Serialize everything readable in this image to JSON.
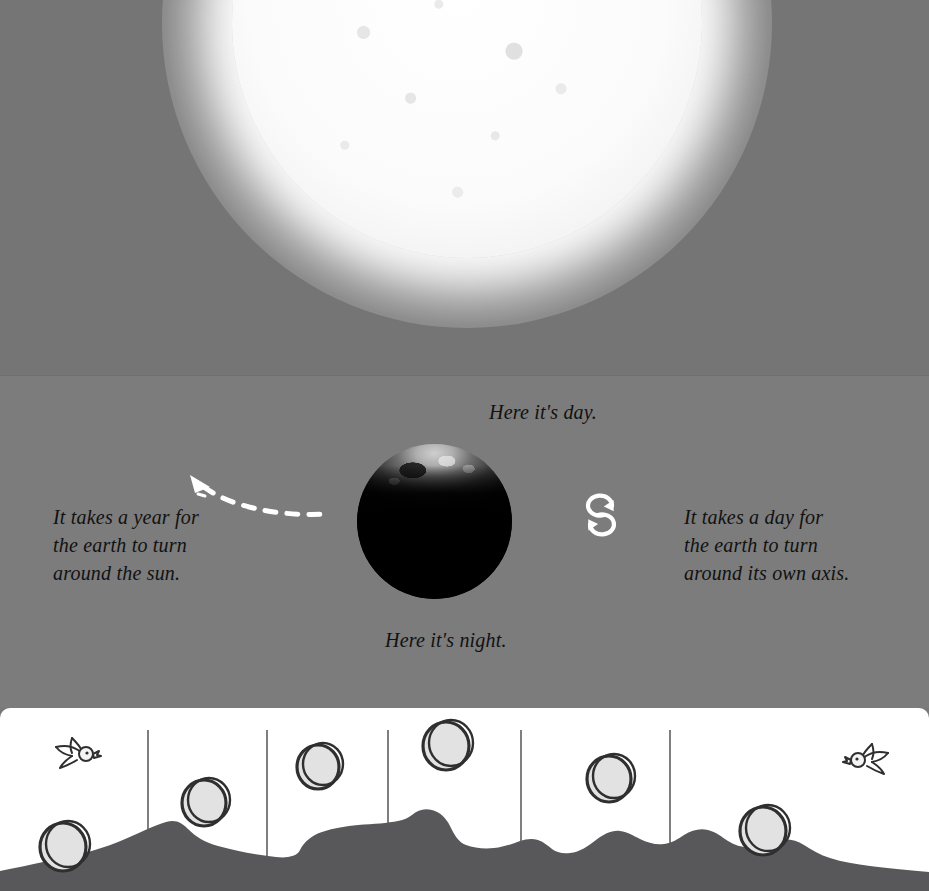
{
  "page": {
    "width": 929,
    "height": 891,
    "background_color": "#787878",
    "panel_background_color": "#ffffff"
  },
  "space_scene": {
    "sun": {
      "name": "sun",
      "color": "#ffffff",
      "glow_color": "#ffffff",
      "description": "bright glowing sun partially cropped at top of frame"
    },
    "earth": {
      "name": "earth",
      "day_side_color": "#cfcfcf",
      "night_side_color": "#050505",
      "description": "earth globe lit on the top half facing the sun, dark on the bottom half"
    },
    "captions": {
      "day": "Here it's day.",
      "night": "Here it's night.",
      "year": "It takes a year for the earth to turn around the sun.",
      "axis": "It takes a day for the earth to turn around its own axis."
    },
    "caption_lines": {
      "year": [
        "It takes a year for",
        "the earth to turn",
        "around the sun."
      ],
      "axis": [
        "It takes a day for",
        "the earth to turn",
        "around its own axis."
      ]
    },
    "text_color": "#111111",
    "orbit_arrow": {
      "name": "dashed-orbit-arrow",
      "color": "#ffffff",
      "direction": "counter-clockwise toward upper-left"
    },
    "rotation_icon": {
      "name": "rotation-arrows-icon",
      "color": "#ffffff",
      "description": "two curved arrows forming a rotation loop"
    }
  },
  "ground_scene": {
    "background_color": "#ffffff",
    "hill_color": "#58585a",
    "line_color": "#3a3a3a",
    "sun_fill_color": "#e2e2e2",
    "sun_stroke_color": "#2f2f2f",
    "bird_stroke_color": "#2f2f2f",
    "description": "hand drawn daytime arc of the sun over rolling hills with two birds",
    "divider_lines_x": [
      148,
      267,
      388,
      521,
      670
    ],
    "sun_positions": [
      {
        "cx": 65,
        "cy": 137,
        "r": 24
      },
      {
        "cx": 206,
        "cy": 93,
        "r": 23
      },
      {
        "cx": 320,
        "cy": 57,
        "r": 22
      },
      {
        "cx": 448,
        "cy": 36,
        "r": 24
      },
      {
        "cx": 611,
        "cy": 69,
        "r": 23
      },
      {
        "cx": 765,
        "cy": 121,
        "r": 24
      }
    ],
    "birds": [
      {
        "cx": 78,
        "cy": 46,
        "facing": "right"
      },
      {
        "cx": 866,
        "cy": 52,
        "facing": "left"
      }
    ]
  }
}
